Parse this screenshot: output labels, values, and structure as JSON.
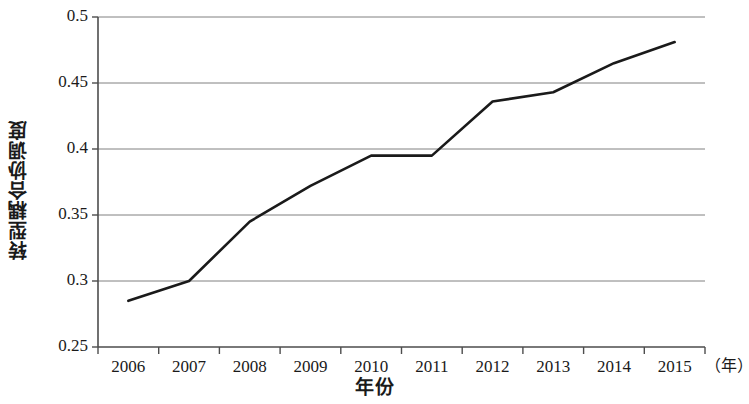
{
  "chart_data": {
    "type": "line",
    "title": "",
    "xlabel": "年份",
    "ylabel": "转型耦合协调度",
    "x_unit_note": "（年）",
    "categories": [
      "2006",
      "2007",
      "2008",
      "2009",
      "2010",
      "2011",
      "2012",
      "2013",
      "2014",
      "2015"
    ],
    "values": [
      0.285,
      0.3,
      0.345,
      0.372,
      0.395,
      0.395,
      0.436,
      0.443,
      0.465,
      0.481
    ],
    "series": [
      {
        "name": "转型耦合协调度",
        "values": [
          0.285,
          0.3,
          0.345,
          0.372,
          0.395,
          0.395,
          0.436,
          0.443,
          0.465,
          0.481
        ]
      }
    ],
    "ylim": [
      0.25,
      0.5
    ],
    "ytick_labels": [
      "0.5",
      "0.45",
      "0.4",
      "0.35",
      "0.3",
      "0.25"
    ],
    "ytick_values": [
      0.5,
      0.45,
      0.4,
      0.35,
      0.3,
      0.25
    ],
    "xtick_labels": [
      "2006",
      "2007",
      "2008",
      "2009",
      "2010",
      "2011",
      "2012",
      "2013",
      "2014",
      "2015"
    ],
    "grid": "horizontal",
    "legend": "none",
    "line_color": "#1a1a1a",
    "grid_color": "#808080",
    "axis_color": "#4d4d4d",
    "background_color": "#ffffff"
  }
}
